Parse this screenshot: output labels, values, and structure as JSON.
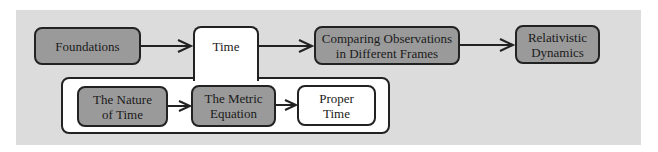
{
  "diagram": {
    "type": "flowchart",
    "background_color": "#dcdcdc",
    "main_flow": [
      {
        "id": "foundations",
        "label": "Foundations",
        "fill": "#9a9a9a"
      },
      {
        "id": "time",
        "label": "Time",
        "fill": "#ffffff"
      },
      {
        "id": "comparing",
        "label": "Comparing Observations\nin Different Frames",
        "fill": "#9a9a9a"
      },
      {
        "id": "relativistic",
        "label": "Relativistic\nDynamics",
        "fill": "#9a9a9a"
      }
    ],
    "time_subtopics": [
      {
        "id": "nature",
        "label": "The Nature\nof Time",
        "fill": "#9a9a9a"
      },
      {
        "id": "metric",
        "label": "The Metric\nEquation",
        "fill": "#9a9a9a"
      },
      {
        "id": "proper",
        "label": "Proper\nTime",
        "fill": "#ffffff"
      }
    ],
    "edges": [
      [
        "foundations",
        "time"
      ],
      [
        "time",
        "comparing"
      ],
      [
        "comparing",
        "relativistic"
      ],
      [
        "nature",
        "metric"
      ],
      [
        "metric",
        "proper"
      ]
    ]
  }
}
